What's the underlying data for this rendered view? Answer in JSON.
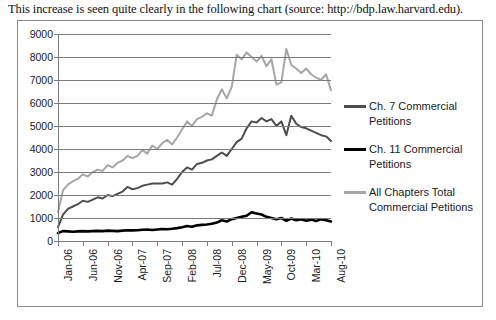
{
  "caption": "This increase is seen quite clearly in the following chart (source: http://bdp.law.harvard.edu).",
  "legend": {
    "items": [
      {
        "label": "Ch. 7 Commercial Petitions",
        "color": "#4d4d4d"
      },
      {
        "label": "Ch. 11 Commercial Petitions",
        "color": "#000000"
      },
      {
        "label": "All Chapters Total Commercial Petitions",
        "color": "#a6a6a6"
      }
    ]
  },
  "chart_data": {
    "type": "line",
    "title": "",
    "xlabel": "",
    "ylabel": "",
    "ylim": [
      0,
      9000
    ],
    "ytick_step": 1000,
    "yticks": [
      0,
      1000,
      2000,
      3000,
      4000,
      5000,
      6000,
      7000,
      8000,
      9000
    ],
    "grid": true,
    "legend_position": "right",
    "x": [
      "Jan-06",
      "Feb-06",
      "Mar-06",
      "Apr-06",
      "May-06",
      "Jun-06",
      "Jul-06",
      "Aug-06",
      "Sep-06",
      "Oct-06",
      "Nov-06",
      "Dec-06",
      "Jan-07",
      "Feb-07",
      "Mar-07",
      "Apr-07",
      "May-07",
      "Jun-07",
      "Jul-07",
      "Aug-07",
      "Sep-07",
      "Oct-07",
      "Nov-07",
      "Dec-07",
      "Jan-08",
      "Feb-08",
      "Mar-08",
      "Apr-08",
      "May-08",
      "Jun-08",
      "Jul-08",
      "Aug-08",
      "Sep-08",
      "Oct-08",
      "Nov-08",
      "Dec-08",
      "Jan-09",
      "Feb-09",
      "Mar-09",
      "Apr-09",
      "May-09",
      "Jun-09",
      "Jul-09",
      "Aug-09",
      "Sep-09",
      "Oct-09",
      "Nov-09",
      "Dec-09",
      "Jan-10",
      "Feb-10",
      "Mar-10",
      "Apr-10",
      "May-10",
      "Jun-10",
      "Jul-10",
      "Aug-10"
    ],
    "xtick_labels": [
      "Jan-06",
      "Jun-06",
      "Nov-06",
      "Apr-07",
      "Sep-07",
      "Feb-08",
      "Jul-08",
      "Dec-08",
      "May-09",
      "Oct-09",
      "Mar-10",
      "Aug-10"
    ],
    "xtick_indices": [
      0,
      5,
      10,
      15,
      20,
      25,
      30,
      35,
      40,
      45,
      50,
      55
    ],
    "series": [
      {
        "name": "Ch. 7 Commercial Petitions",
        "color": "#4d4d4d",
        "width": 2,
        "values": [
          600,
          1150,
          1400,
          1500,
          1600,
          1750,
          1700,
          1800,
          1900,
          1850,
          2000,
          1950,
          2050,
          2150,
          2350,
          2250,
          2300,
          2400,
          2450,
          2500,
          2500,
          2500,
          2550,
          2450,
          2700,
          3000,
          3200,
          3100,
          3350,
          3400,
          3500,
          3550,
          3700,
          3850,
          3700,
          4000,
          4300,
          4450,
          4900,
          5200,
          5150,
          5350,
          5200,
          5300,
          5000,
          5200,
          4600,
          5450,
          5100,
          4950,
          4900,
          4800,
          4700,
          4600,
          4550,
          4350
        ]
      },
      {
        "name": "Ch. 11 Commercial Petitions",
        "color": "#000000",
        "width": 2.6,
        "values": [
          350,
          430,
          420,
          400,
          420,
          430,
          420,
          430,
          440,
          430,
          450,
          440,
          430,
          450,
          470,
          460,
          470,
          490,
          500,
          480,
          500,
          520,
          510,
          530,
          560,
          600,
          650,
          620,
          680,
          700,
          720,
          750,
          800,
          900,
          850,
          950,
          1000,
          1050,
          1100,
          1250,
          1200,
          1150,
          1050,
          1000,
          950,
          1000,
          880,
          980,
          900,
          950,
          880,
          930,
          870,
          950,
          900,
          850
        ]
      },
      {
        "name": "All Chapters Total Commercial Petitions",
        "color": "#a6a6a6",
        "width": 2,
        "values": [
          1250,
          2200,
          2450,
          2600,
          2700,
          2900,
          2800,
          3000,
          3100,
          3050,
          3300,
          3200,
          3400,
          3500,
          3700,
          3600,
          3700,
          3950,
          3800,
          4150,
          4000,
          4250,
          4400,
          4200,
          4500,
          4850,
          5200,
          5000,
          5300,
          5400,
          5550,
          5450,
          6150,
          6600,
          6200,
          6700,
          8100,
          7900,
          8200,
          8000,
          7800,
          8050,
          7600,
          7900,
          6800,
          6900,
          8350,
          7650,
          7500,
          7300,
          7500,
          7250,
          7100,
          7000,
          7250,
          6550
        ]
      }
    ]
  }
}
